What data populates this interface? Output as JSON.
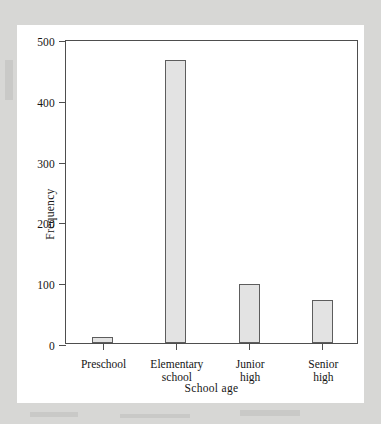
{
  "figure": {
    "background_color": "#d7d7d5",
    "panel_color": "#ffffff",
    "axis_color": "#4e4e4e",
    "bar_fill_color": "#e3e3e3",
    "bar_edge_color": "#5d5d5d"
  },
  "chart_data": {
    "type": "bar",
    "title": "",
    "xlabel": "School age",
    "ylabel": "Frequency",
    "categories": [
      "Preschool",
      "Elementary school",
      "Junior high",
      "Senior high"
    ],
    "category_lines": [
      [
        "Preschool"
      ],
      [
        "Elementary",
        "school"
      ],
      [
        "Junior",
        "high"
      ],
      [
        "Senior",
        "high"
      ]
    ],
    "values": [
      10,
      465,
      97,
      70
    ],
    "ylim": [
      0,
      500
    ],
    "yticks": [
      0,
      100,
      200,
      300,
      400,
      500
    ],
    "ytick_labels": [
      "0",
      "100",
      "200",
      "300",
      "400",
      "500"
    ],
    "grid": false,
    "legend": null
  }
}
